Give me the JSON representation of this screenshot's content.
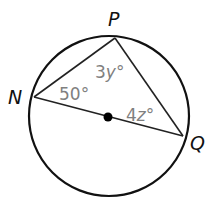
{
  "diagram": {
    "type": "inscribed-triangle-in-circle",
    "points": {
      "N": {
        "label": "N"
      },
      "P": {
        "label": "P"
      },
      "Q": {
        "label": "Q"
      }
    },
    "center_marker": "filled-dot",
    "angles": [
      {
        "vertex": "N",
        "label_num": "50",
        "label_var": "",
        "deg": "°"
      },
      {
        "vertex": "P",
        "label_num": "3",
        "label_var": "y",
        "deg": "°"
      },
      {
        "vertex": "Q",
        "label_num": "4",
        "label_var": "z",
        "deg": "°"
      }
    ],
    "colors": {
      "stroke": "#111111",
      "angle_label": "#808080",
      "background": "#ffffff"
    }
  }
}
